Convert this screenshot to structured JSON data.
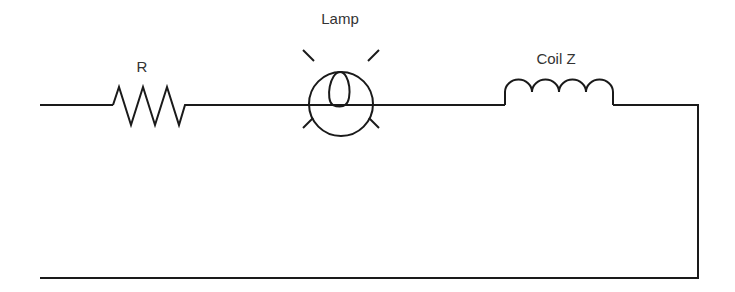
{
  "diagram": {
    "type": "circuit",
    "components": [
      {
        "id": "resistor",
        "label": "R"
      },
      {
        "id": "lamp",
        "label": "Lamp"
      },
      {
        "id": "coil",
        "label": "Coil Z"
      }
    ],
    "colors": {
      "wire": "#1a1a1a",
      "label": "#333333",
      "background": "#ffffff"
    }
  }
}
